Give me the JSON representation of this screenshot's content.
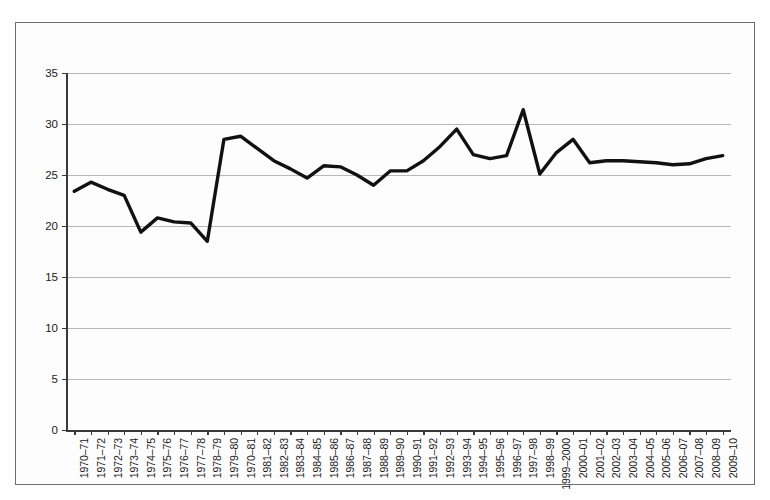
{
  "chart_data": {
    "type": "line",
    "title": "",
    "subtitle": "",
    "xlabel": "",
    "ylabel": "",
    "ylim": [
      0,
      35
    ],
    "yticks": [
      0,
      5,
      10,
      15,
      20,
      25,
      30,
      35
    ],
    "grid": true,
    "legend": "none",
    "line_color": "#111111",
    "categories": [
      "1970–71",
      "1971–72",
      "1972–73",
      "1973–74",
      "1974–75",
      "1975–76",
      "1976–77",
      "1977–78",
      "1978–79",
      "1979–80",
      "1970–81",
      "1981–82",
      "1982–83",
      "1983–84",
      "1984–85",
      "1985–86",
      "1986–87",
      "1987–88",
      "1988–89",
      "1989–90",
      "1990–91",
      "1991–92",
      "1992–93",
      "1993–94",
      "1994–95",
      "1995–96",
      "1996–97",
      "1997–98",
      "1998–99",
      "1999–2000",
      "2000–01",
      "2001–02",
      "2002–03",
      "2003–04",
      "2004–05",
      "2005–06",
      "2006–07",
      "2007–08",
      "2008–09",
      "2009–10"
    ],
    "values": [
      23.4,
      24.3,
      23.6,
      23.0,
      19.4,
      20.8,
      20.4,
      20.3,
      18.5,
      28.5,
      28.8,
      27.6,
      26.4,
      25.6,
      24.7,
      25.9,
      25.8,
      25.0,
      24.0,
      25.4,
      25.4,
      26.4,
      27.8,
      29.5,
      27.0,
      26.6,
      26.9,
      31.4,
      25.1,
      27.2,
      28.5,
      26.2,
      26.4,
      26.4,
      26.3,
      26.2,
      26.0,
      26.1,
      26.6,
      26.9
    ]
  }
}
